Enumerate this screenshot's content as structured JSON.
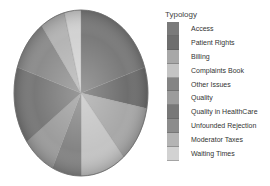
{
  "chart_data": {
    "type": "pie",
    "title": "",
    "legend_title": "Typology",
    "legend_position": "right",
    "categories": [
      "Access",
      "Patient Rights",
      "Billing",
      "Complaints Book",
      "Other Issues",
      "Quality",
      "Quality in HealthCare",
      "Unfounded Rejection",
      "Moderator Taxes",
      "Waiting Times"
    ],
    "values": [
      20,
      8,
      11,
      11,
      7,
      8,
      15,
      10,
      6,
      4
    ],
    "colors": [
      "#7a7a7a",
      "#6e6e6e",
      "#a8a8a8",
      "#c4c4c4",
      "#848484",
      "#9c9c9c",
      "#787878",
      "#8c8c8c",
      "#b4b4b4",
      "#d2d2d2"
    ],
    "start_angle_deg": 0,
    "direction": "clockwise"
  },
  "legend": {
    "title": "Typology",
    "items": [
      {
        "label": "Access"
      },
      {
        "label": "Patient Rights"
      },
      {
        "label": "Billing"
      },
      {
        "label": "Complaints Book"
      },
      {
        "label": "Other Issues"
      },
      {
        "label": "Quality"
      },
      {
        "label": "Quality in HealthCare"
      },
      {
        "label": "Unfounded Rejection"
      },
      {
        "label": "Moderator Taxes"
      },
      {
        "label": "Waiting Times"
      }
    ]
  }
}
